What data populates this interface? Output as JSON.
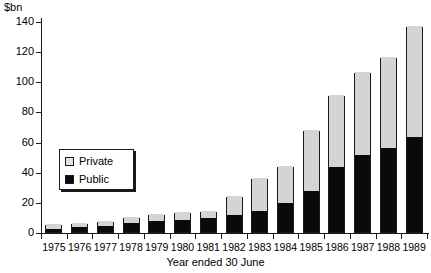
{
  "chart_data": {
    "type": "bar",
    "subtype": "stacked-vertical",
    "title": "",
    "subtitle": "",
    "xlabel": "Year ended 30 June",
    "ylabel": "$bn",
    "y_unit_caption": "$bn",
    "categories": [
      "1975",
      "1976",
      "1977",
      "1978",
      "1979",
      "1980",
      "1981",
      "1982",
      "1983",
      "1984",
      "1985",
      "1986",
      "1987",
      "1988",
      "1989"
    ],
    "series": [
      {
        "name": "Public",
        "color": "#0a0a0a",
        "values": [
          2,
          3,
          4,
          6,
          7,
          8,
          9,
          11,
          14,
          19,
          27,
          43,
          51,
          56,
          63
        ]
      },
      {
        "name": "Private",
        "color": "#d4d4d4",
        "values": [
          3,
          3,
          3,
          4,
          5,
          5,
          5,
          13,
          22,
          25,
          41,
          48,
          55,
          60,
          74
        ]
      }
    ],
    "totals": [
      5,
      6,
      7,
      10,
      12,
      13,
      14,
      24,
      36,
      44,
      68,
      91,
      106,
      116,
      137
    ],
    "ylim": [
      0,
      140
    ],
    "y_ticks": [
      0,
      20,
      40,
      60,
      80,
      100,
      120,
      140
    ],
    "y_tick_labels": [
      "0",
      "20",
      "40",
      "60",
      "80",
      "100",
      "120",
      "140"
    ],
    "grid": false,
    "legend_position": "inside-left",
    "legend_entries": [
      "Private",
      "Public"
    ]
  },
  "axes": {
    "x_title": "Year ended 30 June",
    "y_unit": "$bn"
  },
  "legend": {
    "private_label": "Private",
    "public_label": "Public",
    "private_color": "#d4d4d4",
    "public_color": "#0a0a0a"
  }
}
